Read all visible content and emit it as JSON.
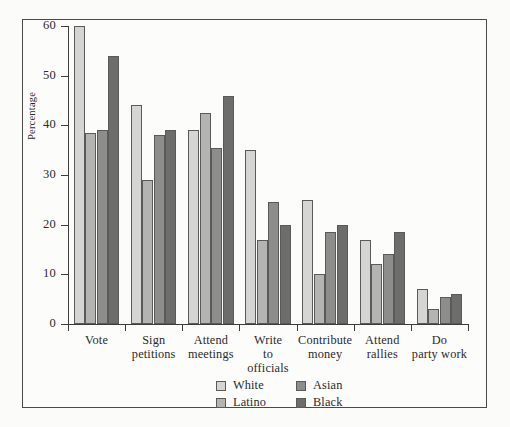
{
  "chart_data": {
    "type": "bar",
    "title": "",
    "xlabel": "",
    "ylabel": "Percentage",
    "ylim": [
      0,
      60
    ],
    "yticks": [
      0,
      10,
      20,
      30,
      40,
      50,
      60
    ],
    "grid": false,
    "legend_position": "bottom-center",
    "categories": [
      "Vote",
      "Sign petitions",
      "Attend meetings",
      "Write to officials",
      "Contribute money",
      "Attend rallies",
      "Do party work"
    ],
    "category_lines": [
      [
        "Vote"
      ],
      [
        "Sign",
        "petitions"
      ],
      [
        "Attend",
        "meetings"
      ],
      [
        "Write",
        "to",
        "officials"
      ],
      [
        "Contribute",
        "money"
      ],
      [
        "Attend",
        "rallies"
      ],
      [
        "Do",
        "party work"
      ]
    ],
    "series": [
      {
        "name": "White",
        "color": "#d5d5d3",
        "values": [
          60,
          44,
          39,
          35,
          25,
          17,
          7
        ]
      },
      {
        "name": "Latino",
        "color": "#b4b4b2",
        "values": [
          38.5,
          29,
          42.5,
          17,
          10,
          12,
          3
        ]
      },
      {
        "name": "Asian",
        "color": "#8d8d8c",
        "values": [
          39,
          38,
          35.5,
          24.5,
          18.5,
          14,
          5.5
        ]
      },
      {
        "name": "Black",
        "color": "#6d6d6c",
        "values": [
          54,
          39,
          46,
          20,
          20,
          18.5,
          6
        ]
      }
    ]
  },
  "legend": {
    "entries": [
      {
        "label": "White"
      },
      {
        "label": "Asian"
      },
      {
        "label": "Latino"
      },
      {
        "label": "Black"
      }
    ]
  }
}
